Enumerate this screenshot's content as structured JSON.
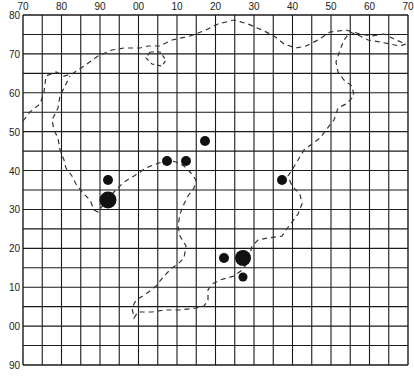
{
  "colors": {
    "background": "#ffffff",
    "grid": "#1a1a1a",
    "boundary": "#333333",
    "marker": "#111111",
    "label": "#222222"
  },
  "grid": {
    "left": 23,
    "top": 15,
    "right": 408,
    "bottom": 365,
    "columns": 20,
    "rows": 18
  },
  "top_axis": {
    "labels": [
      "70",
      "80",
      "90",
      "00",
      "10",
      "20",
      "30",
      "40",
      "50",
      "60",
      "70"
    ]
  },
  "left_axis": {
    "labels": [
      "80",
      "70",
      "60",
      "50",
      "40",
      "30",
      "20",
      "10",
      "00",
      "90"
    ]
  },
  "boundary": {
    "style": "dashed",
    "points": [
      [
        23,
        121
      ],
      [
        30,
        112
      ],
      [
        40,
        104
      ],
      [
        44,
        92
      ],
      [
        46,
        76
      ],
      [
        56,
        72
      ],
      [
        64,
        76
      ],
      [
        72,
        74
      ],
      [
        84,
        66
      ],
      [
        98,
        56
      ],
      [
        112,
        50
      ],
      [
        124,
        48
      ],
      [
        140,
        48
      ],
      [
        148,
        46
      ],
      [
        160,
        46
      ],
      [
        172,
        40
      ],
      [
        190,
        36
      ],
      [
        206,
        30
      ],
      [
        218,
        24
      ],
      [
        234,
        20
      ],
      [
        248,
        24
      ],
      [
        262,
        30
      ],
      [
        274,
        36
      ],
      [
        284,
        44
      ],
      [
        296,
        48
      ],
      [
        306,
        46
      ],
      [
        318,
        40
      ],
      [
        330,
        32
      ],
      [
        346,
        30
      ],
      [
        360,
        34
      ],
      [
        372,
        36
      ],
      [
        384,
        34
      ],
      [
        396,
        40
      ],
      [
        406,
        44
      ],
      [
        406,
        44
      ],
      [
        400,
        46
      ],
      [
        390,
        44
      ],
      [
        380,
        42
      ],
      [
        368,
        40
      ],
      [
        360,
        36
      ],
      [
        350,
        32
      ],
      [
        344,
        40
      ],
      [
        340,
        50
      ],
      [
        336,
        62
      ],
      [
        338,
        72
      ],
      [
        344,
        80
      ],
      [
        352,
        86
      ],
      [
        354,
        96
      ],
      [
        346,
        104
      ],
      [
        338,
        108
      ],
      [
        334,
        120
      ],
      [
        326,
        130
      ],
      [
        320,
        138
      ],
      [
        312,
        144
      ],
      [
        304,
        150
      ],
      [
        298,
        160
      ],
      [
        292,
        170
      ],
      [
        288,
        176
      ],
      [
        292,
        186
      ],
      [
        300,
        194
      ],
      [
        302,
        204
      ],
      [
        298,
        214
      ],
      [
        292,
        222
      ],
      [
        286,
        230
      ],
      [
        282,
        236
      ],
      [
        268,
        238
      ],
      [
        258,
        240
      ],
      [
        252,
        246
      ],
      [
        250,
        254
      ],
      [
        248,
        262
      ],
      [
        242,
        270
      ],
      [
        234,
        276
      ],
      [
        220,
        280
      ],
      [
        212,
        284
      ],
      [
        208,
        290
      ],
      [
        208,
        300
      ],
      [
        204,
        306
      ],
      [
        196,
        308
      ],
      [
        180,
        310
      ],
      [
        164,
        310
      ],
      [
        152,
        312
      ],
      [
        138,
        312
      ],
      [
        134,
        318
      ],
      [
        132,
        308
      ],
      [
        136,
        300
      ],
      [
        146,
        294
      ],
      [
        156,
        286
      ],
      [
        164,
        276
      ],
      [
        172,
        268
      ],
      [
        178,
        264
      ],
      [
        184,
        258
      ],
      [
        186,
        246
      ],
      [
        180,
        236
      ],
      [
        178,
        226
      ],
      [
        180,
        214
      ],
      [
        184,
        204
      ],
      [
        188,
        196
      ],
      [
        194,
        188
      ],
      [
        196,
        180
      ],
      [
        190,
        172
      ],
      [
        184,
        166
      ],
      [
        176,
        162
      ],
      [
        168,
        160
      ],
      [
        156,
        164
      ],
      [
        146,
        168
      ],
      [
        134,
        176
      ],
      [
        124,
        182
      ],
      [
        116,
        190
      ],
      [
        110,
        196
      ],
      [
        104,
        204
      ],
      [
        98,
        212
      ],
      [
        94,
        210
      ],
      [
        90,
        200
      ],
      [
        82,
        192
      ],
      [
        76,
        184
      ],
      [
        72,
        176
      ],
      [
        66,
        168
      ],
      [
        64,
        160
      ],
      [
        60,
        150
      ],
      [
        58,
        138
      ],
      [
        54,
        130
      ],
      [
        52,
        120
      ],
      [
        58,
        108
      ],
      [
        60,
        96
      ],
      [
        66,
        84
      ],
      [
        70,
        76
      ]
    ]
  },
  "inner_loops": [
    {
      "points": [
        [
          150,
          52
        ],
        [
          146,
          58
        ],
        [
          152,
          64
        ],
        [
          162,
          66
        ],
        [
          166,
          60
        ],
        [
          160,
          52
        ],
        [
          150,
          52
        ]
      ]
    }
  ],
  "markers": [
    {
      "name": "site-1",
      "x": 108,
      "y": 180,
      "r": 5
    },
    {
      "name": "site-2",
      "x": 108,
      "y": 200,
      "r": 8.5
    },
    {
      "name": "site-3",
      "x": 167,
      "y": 161,
      "r": 5
    },
    {
      "name": "site-4",
      "x": 186,
      "y": 161,
      "r": 5
    },
    {
      "name": "site-5",
      "x": 205,
      "y": 141,
      "r": 5
    },
    {
      "name": "site-6",
      "x": 282,
      "y": 180,
      "r": 5
    },
    {
      "name": "site-7",
      "x": 224,
      "y": 258,
      "r": 5
    },
    {
      "name": "site-8",
      "x": 243,
      "y": 258,
      "r": 8
    },
    {
      "name": "site-9",
      "x": 243,
      "y": 277,
      "r": 4.5
    }
  ]
}
